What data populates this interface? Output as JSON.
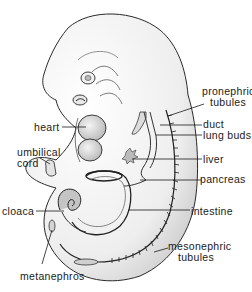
{
  "figure": {
    "top_edge_text_truncated": true
  },
  "labels": {
    "pronephric_tubules": {
      "line1": "pronephric",
      "line2": "tubules"
    },
    "duct": "duct",
    "lung_buds": "lung buds",
    "heart": "heart",
    "umbilical_cord": {
      "line1": "umbilical",
      "line2": "cord"
    },
    "liver": "liver",
    "pancreas": "pancreas",
    "cloaca": "cloaca",
    "intestine": "intestine",
    "mesonephric_tubules": {
      "line1": "mesonephric",
      "line2": "tubules"
    },
    "metanephros": "metanephros"
  },
  "colors": {
    "outline": "#2a2a2a",
    "shading": "#cfcfcf",
    "organ_fill": "#bdbdbd",
    "background": "#ffffff"
  }
}
